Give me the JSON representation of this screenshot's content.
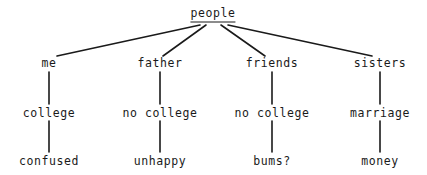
{
  "diagram": {
    "title": "people",
    "type": "tree-diagram",
    "background_color": "#ffffff",
    "text_color": "#1a1a1a",
    "line_color": "#1a1a1a",
    "root": {
      "label": "people",
      "underlined": true,
      "x": 213,
      "y": 14
    },
    "branches": [
      {
        "level1": {
          "label": "me",
          "x": 49,
          "y": 63
        },
        "level2": {
          "label": "college",
          "x": 49,
          "y": 113
        },
        "level3": {
          "label": "confused",
          "x": 49,
          "y": 161
        }
      },
      {
        "level1": {
          "label": "father",
          "x": 160,
          "y": 63
        },
        "level2": {
          "label": "no college",
          "x": 160,
          "y": 113
        },
        "level3": {
          "label": "unhappy",
          "x": 160,
          "y": 161
        }
      },
      {
        "level1": {
          "label": "friends",
          "x": 272,
          "y": 63
        },
        "level2": {
          "label": "no college",
          "x": 272,
          "y": 113
        },
        "level3": {
          "label": "bums?",
          "x": 272,
          "y": 161
        }
      },
      {
        "level1": {
          "label": "sisters",
          "x": 380,
          "y": 63
        },
        "level2": {
          "label": "marriage",
          "x": 380,
          "y": 113
        },
        "level3": {
          "label": "money",
          "x": 380,
          "y": 161
        }
      }
    ],
    "edges": {
      "diagonal": [
        {
          "x1": 200,
          "y1": 25,
          "x2": 57,
          "y2": 56
        },
        {
          "x1": 206,
          "y1": 25,
          "x2": 163,
          "y2": 56
        },
        {
          "x1": 221,
          "y1": 25,
          "x2": 265,
          "y2": 56
        },
        {
          "x1": 228,
          "y1": 25,
          "x2": 372,
          "y2": 56
        }
      ],
      "vertical": [
        {
          "x": 49,
          "y1": 72,
          "y2": 104
        },
        {
          "x": 160,
          "y1": 72,
          "y2": 104
        },
        {
          "x": 272,
          "y1": 72,
          "y2": 104
        },
        {
          "x": 380,
          "y1": 72,
          "y2": 104
        },
        {
          "x": 49,
          "y1": 121,
          "y2": 152
        },
        {
          "x": 160,
          "y1": 121,
          "y2": 152
        },
        {
          "x": 272,
          "y1": 121,
          "y2": 152
        },
        {
          "x": 380,
          "y1": 121,
          "y2": 152
        }
      ]
    }
  }
}
